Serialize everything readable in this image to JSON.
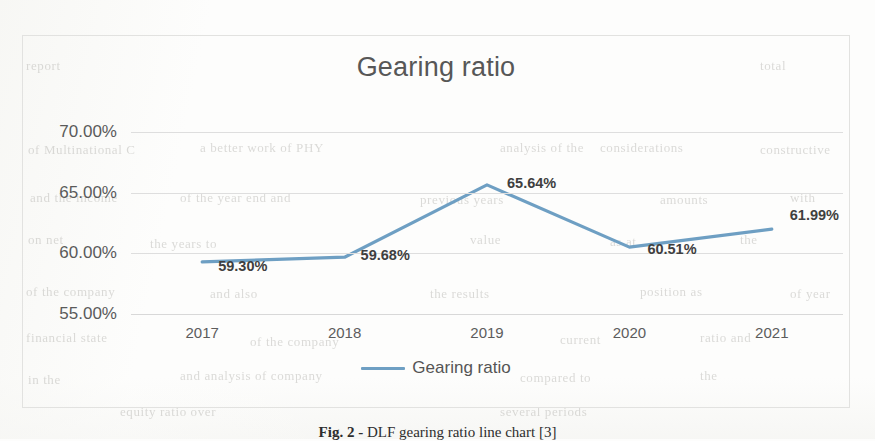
{
  "page": {
    "caption": "Fig. 2 - DLF gearing ratio line chart [3]",
    "caption_bold_part": "Fig. 2 -",
    "caption_rest": " DLF gearing ratio line chart [3]"
  },
  "colors": {
    "series_line": "#6e9fc3",
    "gridline": "#dedede",
    "chart_border": "#e2e2e0",
    "title_text": "#575757",
    "label_text": "#3f3f3f",
    "page_background": "#fdfdfc"
  },
  "legend": {
    "position": "bottom",
    "entries": [
      {
        "label": "Gearing ratio",
        "color": "#6e9fc3",
        "marker": "line"
      }
    ]
  },
  "chart_data": {
    "type": "line",
    "title": "Gearing ratio",
    "subtitle": "",
    "xlabel": "",
    "ylabel": "",
    "categories": [
      "2017",
      "2018",
      "2019",
      "2020",
      "2021"
    ],
    "values": [
      59.3,
      59.68,
      65.64,
      60.51,
      61.99
    ],
    "value_labels": [
      "59.30%",
      "59.68%",
      "65.64%",
      "60.51%",
      "61.99%"
    ],
    "ylim": [
      55.0,
      70.0
    ],
    "ytick_values": [
      70.0,
      65.0,
      60.0,
      55.0
    ],
    "ytick_labels": [
      "70.00%",
      "65.00%",
      "60.00%",
      "55.00%"
    ],
    "grid": true,
    "grid_axis": "y",
    "legend_position": "bottom",
    "series": [
      {
        "name": "Gearing ratio",
        "color": "#6e9fc3",
        "values": [
          59.3,
          59.68,
          65.64,
          60.51,
          61.99
        ]
      }
    ]
  },
  "ghost_text": {
    "lines": [
      {
        "text": "of Multinational C",
        "x": 28,
        "y": 142,
        "size": 13
      },
      {
        "text": "a better work of PHY",
        "x": 200,
        "y": 140,
        "size": 13
      },
      {
        "text": "analysis of the",
        "x": 500,
        "y": 140,
        "size": 13
      },
      {
        "text": "considerations",
        "x": 600,
        "y": 140,
        "size": 13
      },
      {
        "text": "constructive",
        "x": 760,
        "y": 142,
        "size": 13
      },
      {
        "text": "and the income",
        "x": 30,
        "y": 190,
        "size": 13
      },
      {
        "text": "of the year end and",
        "x": 180,
        "y": 190,
        "size": 13
      },
      {
        "text": "previous years",
        "x": 420,
        "y": 192,
        "size": 13
      },
      {
        "text": "amounts",
        "x": 660,
        "y": 192,
        "size": 13
      },
      {
        "text": "with",
        "x": 790,
        "y": 190,
        "size": 13
      },
      {
        "text": "on net",
        "x": 28,
        "y": 232,
        "size": 13
      },
      {
        "text": "the years to",
        "x": 150,
        "y": 236,
        "size": 13
      },
      {
        "text": "value",
        "x": 470,
        "y": 232,
        "size": 13
      },
      {
        "text": "as at",
        "x": 610,
        "y": 234,
        "size": 13
      },
      {
        "text": "the",
        "x": 740,
        "y": 232,
        "size": 13
      },
      {
        "text": "of the company",
        "x": 26,
        "y": 284,
        "size": 13
      },
      {
        "text": "and also",
        "x": 210,
        "y": 286,
        "size": 13
      },
      {
        "text": "the results",
        "x": 430,
        "y": 286,
        "size": 13
      },
      {
        "text": "position as",
        "x": 640,
        "y": 284,
        "size": 13
      },
      {
        "text": "of year",
        "x": 790,
        "y": 286,
        "size": 13
      },
      {
        "text": "financial state",
        "x": 26,
        "y": 330,
        "size": 13
      },
      {
        "text": "of the company",
        "x": 250,
        "y": 334,
        "size": 13
      },
      {
        "text": "current",
        "x": 560,
        "y": 332,
        "size": 13
      },
      {
        "text": "ratio and",
        "x": 700,
        "y": 330,
        "size": 13
      },
      {
        "text": "and analysis of company",
        "x": 180,
        "y": 368,
        "size": 13
      },
      {
        "text": "compared to",
        "x": 520,
        "y": 370,
        "size": 13
      },
      {
        "text": "the",
        "x": 700,
        "y": 368,
        "size": 13
      },
      {
        "text": "in the",
        "x": 28,
        "y": 372,
        "size": 13
      },
      {
        "text": "report",
        "x": 26,
        "y": 58,
        "size": 13
      },
      {
        "text": "total",
        "x": 760,
        "y": 58,
        "size": 13
      },
      {
        "text": "equity ratio over",
        "x": 120,
        "y": 404,
        "size": 13
      },
      {
        "text": "several periods",
        "x": 500,
        "y": 404,
        "size": 13
      }
    ]
  }
}
